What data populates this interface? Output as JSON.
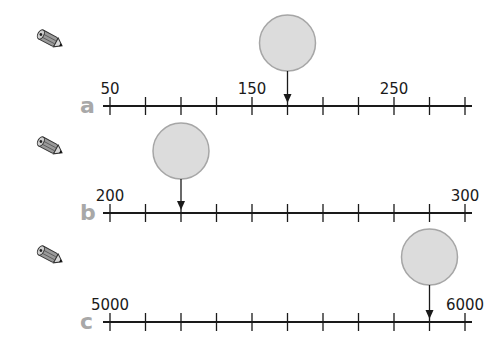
{
  "problems": [
    {
      "letter": "a",
      "start": 50,
      "end": 300,
      "step": 25,
      "labels": [
        {
          "tick": 0,
          "text": "50"
        },
        {
          "tick": 4,
          "text": "150"
        },
        {
          "tick": 8,
          "text": "250"
        }
      ],
      "arrow_tick": 5,
      "answer_circle": "",
      "line_y": 106,
      "circle_cy": 43
    },
    {
      "letter": "b",
      "start": 200,
      "end": 300,
      "step": 10,
      "labels": [
        {
          "tick": 0,
          "text": "200"
        },
        {
          "tick": 10,
          "text": "300"
        }
      ],
      "arrow_tick": 2,
      "answer_circle": "",
      "line_y": 213,
      "circle_cy": 151
    },
    {
      "letter": "c",
      "start": 5000,
      "end": 6000,
      "step": 100,
      "labels": [
        {
          "tick": 0,
          "text": "5000"
        },
        {
          "tick": 10,
          "text": "6000"
        }
      ],
      "arrow_tick": 9,
      "answer_circle": "",
      "line_y": 322,
      "circle_cy": 257
    }
  ],
  "colors": {
    "circle_fill": "#dcdcdc",
    "circle_stroke": "#a6a6a6",
    "letter": "#a8a8a8",
    "line": "#1a1a1a"
  }
}
